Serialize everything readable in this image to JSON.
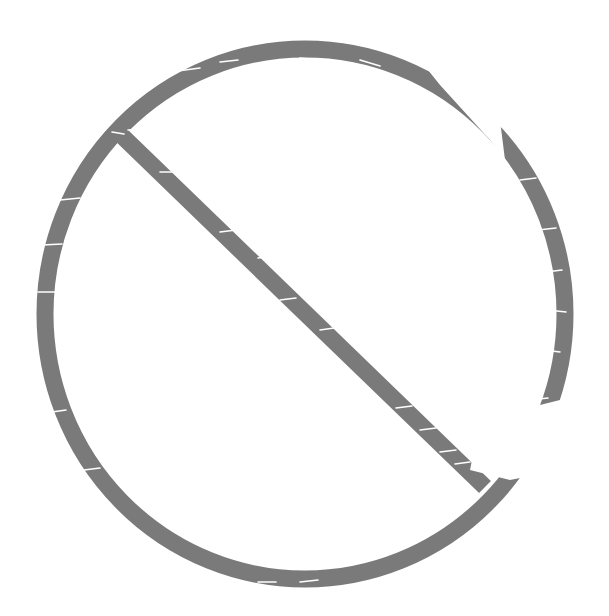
{
  "image": {
    "subject": "prohibited-sign",
    "style": "grunge distressed",
    "colors": {
      "background": "#ffffff",
      "symbol": "#7a7a7a",
      "scratch": "#ffffff"
    }
  }
}
